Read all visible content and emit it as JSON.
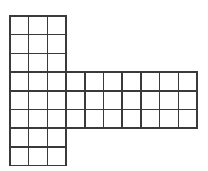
{
  "figure": {
    "type": "grid-diagram",
    "canvas": {
      "width": 208,
      "height": 171,
      "background_color": "#ffffff"
    },
    "stroke": {
      "color": "#3a3a3a",
      "width": 1.4,
      "accent_color": "#8c8c8c"
    },
    "geometry": {
      "cell_size": 18.7,
      "origin_x": 10,
      "origin_y": 16,
      "unit_label": "square"
    },
    "parts": [
      {
        "name": "vertical-column",
        "columns": 3,
        "rows": 8,
        "col_start": 0,
        "row_start": 0,
        "squares": 24
      },
      {
        "name": "horizontal-arm",
        "columns": 7,
        "rows": 3,
        "col_start": 3,
        "row_start": 3,
        "squares": 21
      }
    ],
    "totals": {
      "total_squares": 45,
      "total_columns": 10,
      "total_rows": 8
    }
  }
}
